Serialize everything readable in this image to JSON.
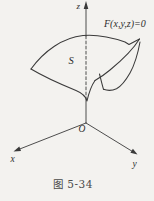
{
  "figure": {
    "caption": "图 5-34",
    "labels": {
      "equation": "F(x,y,z)=0",
      "surface": "S",
      "origin": "O",
      "axis_x": "x",
      "axis_y": "y",
      "axis_z": "z"
    },
    "colors": {
      "line": "#3a3a3a",
      "text": "#2e2e2e",
      "caption": "#4a4a4a",
      "background": "#f3f2ef"
    }
  }
}
